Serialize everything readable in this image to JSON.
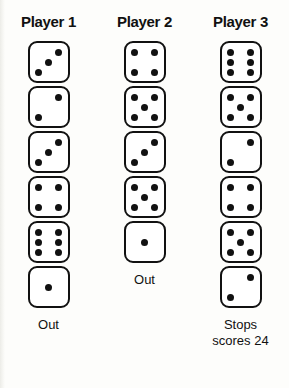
{
  "theme": {
    "background": "#fdfdfb",
    "die_face": "#ffffff",
    "ink": "#111111"
  },
  "columns": [
    {
      "title": "Player 1",
      "rolls": [
        3,
        2,
        3,
        4,
        6,
        1
      ],
      "status": "Out"
    },
    {
      "title": "Player 2",
      "rolls": [
        4,
        5,
        3,
        5,
        1
      ],
      "status": "Out"
    },
    {
      "title": "Player 3",
      "rolls": [
        6,
        5,
        2,
        4,
        5,
        2
      ],
      "status": "Stops\nscores 24"
    }
  ]
}
